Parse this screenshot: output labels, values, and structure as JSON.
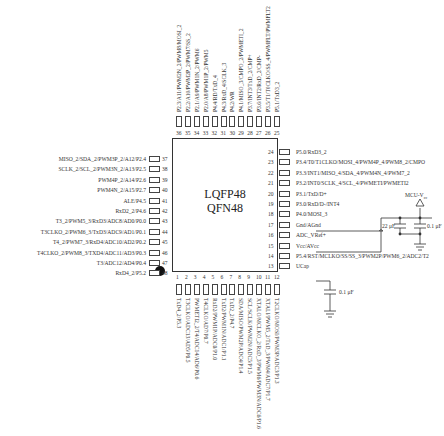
{
  "chip": {
    "name_line1": "LQFP48",
    "name_line2": "QFN48"
  },
  "pins_right": [
    {
      "num": "24",
      "label": "P5.0/RxD3_2"
    },
    {
      "num": "23",
      "label": "P3.4/T0/T1CLKO/MOSI_4/PWM4P_4/PWM8_2/CMPO"
    },
    {
      "num": "22",
      "label": "P3.3/INT1/MISO_4/SDA_4/PWM4N_4/PWM7_2"
    },
    {
      "num": "21",
      "label": "P3.2/INT0/SCLK_4/SCL_4/PWMETI/PWMETI2"
    },
    {
      "num": "20",
      "label": "P3.1/TxD/D+"
    },
    {
      "num": "19",
      "label": "P3.0/RxD/D-/INT4"
    },
    {
      "num": "18",
      "label": "P4.0/MOSI_3"
    },
    {
      "num": "17",
      "label": "Gnd/AGnd"
    },
    {
      "num": "16",
      "label": "ADC_VRef+"
    },
    {
      "num": "15",
      "label": "Vcc/AVcc"
    },
    {
      "num": "14",
      "label": "P5.4/RST/MCLKO/SS/SS_3/PWM2P/PWM6_2/ADC2/T2"
    },
    {
      "num": "13",
      "label": "UCap"
    }
  ],
  "pins_left": [
    {
      "num": "37",
      "label": "MISO_2/SDA_2/PWM3P_2/A12/P2.4"
    },
    {
      "num": "38",
      "label": "SCLK_2/SCL_2/PWM3N_2/A13/P2.5"
    },
    {
      "num": "39",
      "label": "PWM4P_2/A14/P2.6"
    },
    {
      "num": "40",
      "label": "PWM4N_2/A15/P2.7"
    },
    {
      "num": "41",
      "label": "ALE/P4.5"
    },
    {
      "num": "42",
      "label": "RxD2_2/P4.6"
    },
    {
      "num": "43",
      "label": "T3_2/PWM5_3/RxD3/ADC8/AD0/P0.0"
    },
    {
      "num": "44",
      "label": "T3CLKO_2/PWM6_3/TxD3/ADC9/AD1/P0.1"
    },
    {
      "num": "45",
      "label": "T4_2/PWM7_3/RxD4/ADC10/AD2/P0.2"
    },
    {
      "num": "46",
      "label": "T4CLKO_2/PWM8_3/TXD4/ADC11/AD3/P0.3"
    },
    {
      "num": "47",
      "label": "T3/ADC12/AD4/P0.4"
    },
    {
      "num": "48",
      "label": "RxD4_2/P5.2"
    }
  ],
  "pins_top": [
    {
      "num": "36",
      "label": "P2.3/A11/PWM2N_2/PWM8/MOSI_2"
    },
    {
      "num": "35",
      "label": "P2.2/A10/PWM2P_2/PWM7/SS_2"
    },
    {
      "num": "34",
      "label": "P2.1/A9/PWM1N_2/PWM6"
    },
    {
      "num": "33",
      "label": "P2.0/A8/PWM1P_2/PWM5"
    },
    {
      "num": "32",
      "label": "P4.4/RD/TxD_4"
    },
    {
      "num": "31",
      "label": "P4.3/RxD_4/SCLK_3"
    },
    {
      "num": "30",
      "label": "P4.2/WR"
    },
    {
      "num": "29",
      "label": "P4.1/MISO_3/CMPO_2/PWMETI_2"
    },
    {
      "num": "28",
      "label": "P3.7/INT3/TxD_2/CMP+"
    },
    {
      "num": "27",
      "label": "P3.6/INT2/RxD_2/CMP-"
    },
    {
      "num": "26",
      "label": "P3.5/T1/T0CLKO/SS_4/PWMFLT/PWMFLT2"
    },
    {
      "num": "25",
      "label": "P5.1/TxD3_2"
    }
  ],
  "pins_bottom": [
    {
      "num": "1",
      "label": "TxD4_2/P5.3"
    },
    {
      "num": "2",
      "label": "T3CLKO/ADC13/AD5/P0.5"
    },
    {
      "num": "3",
      "label": "PWMETI2_2/T4/ADC14/AD6/P0.6"
    },
    {
      "num": "4",
      "label": "T4CLKO/AD7/P0.7"
    },
    {
      "num": "5",
      "label": "RxD2/PWM1P/ADC0/P1.0"
    },
    {
      "num": "6",
      "label": "TxD2/PWM1N/ADC1/P1.1"
    },
    {
      "num": "7",
      "label": "TxD2_2/P4.7"
    },
    {
      "num": "8",
      "label": "SDA/MISO/PWM2P/ADC4/P1.4"
    },
    {
      "num": "9",
      "label": "SCL/SCLK/PWM2N/ADC5/P1.5"
    },
    {
      "num": "10",
      "label": "XTALO/MCLKO_2/RxD_3/PWM6/PWM3N/ADC6/P1.6"
    },
    {
      "num": "11",
      "label": "XTALI/PWM5_2/TxD_3/PWM4/ADC7/P1.7"
    },
    {
      "num": "12",
      "label": "T2CLKO/MOSI/PWM3P/ADC3/P1.3"
    }
  ],
  "power": {
    "supply_label": "MCU-Vₙₙ",
    "supply_main": "MCU-V",
    "supply_sub": "cc",
    "cap_bulk": "22 μF",
    "cap_decoupling": "0.1 μF",
    "cap_ucap": "0.1 μF"
  },
  "colors": {
    "line": "#333333",
    "background": "#ffffff"
  }
}
